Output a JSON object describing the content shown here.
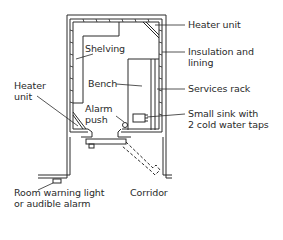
{
  "diagram": {
    "type": "floor-plan",
    "stroke_color": "#2a2a2a",
    "background_color": "#ffffff"
  },
  "labels": {
    "heater_unit_top": "Heater unit",
    "insulation_line1": "Insulation and",
    "insulation_line2": "lining",
    "services_rack": "Services rack",
    "sink_line1": "Small sink with",
    "sink_line2": "2 cold water taps",
    "shelving": "Shelving",
    "bench": "Bench",
    "heater_unit_left_line1": "Heater",
    "heater_unit_left_line2": "unit",
    "alarm_line1": "Alarm",
    "alarm_line2": "push",
    "room_warning_line1": "Room warning light",
    "room_warning_line2": "or audible alarm",
    "corridor": "Corridor"
  }
}
